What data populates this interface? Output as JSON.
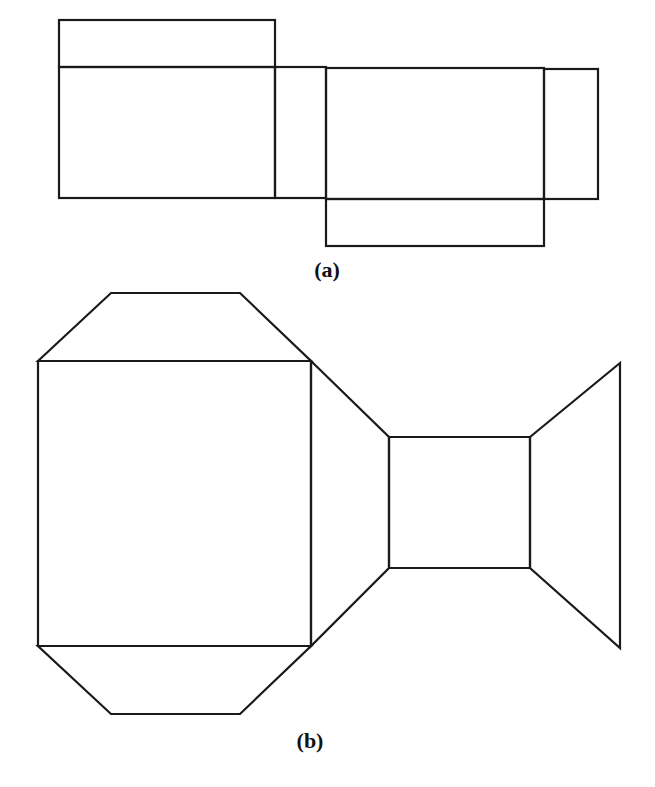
{
  "figure": {
    "stroke_color": "#1a1a1a",
    "background": "#ffffff",
    "panels": [
      {
        "id": "a",
        "caption": "(a)",
        "caption_pos": {
          "x": 327,
          "y": 257
        },
        "description": "Unfolded box net made of rectangles",
        "shapes": [
          {
            "name": "top-flap",
            "type": "rect",
            "x": 59,
            "y": 20,
            "w": 216,
            "h": 47
          },
          {
            "name": "left-face",
            "type": "rect",
            "x": 59,
            "y": 67,
            "w": 216,
            "h": 131
          },
          {
            "name": "left-side-strip",
            "type": "rect",
            "x": 275,
            "y": 67,
            "w": 51,
            "h": 131
          },
          {
            "name": "center-face",
            "type": "rect",
            "x": 326,
            "y": 68,
            "w": 218,
            "h": 131
          },
          {
            "name": "right-side-strip",
            "type": "rect",
            "x": 544,
            "y": 69,
            "w": 54,
            "h": 130
          },
          {
            "name": "bottom-flap",
            "type": "rect",
            "x": 326,
            "y": 199,
            "w": 218,
            "h": 47
          }
        ]
      },
      {
        "id": "b",
        "caption": "(b)",
        "caption_pos": {
          "x": 310,
          "y": 728
        },
        "description": "Perspective room unfold with trapezoid walls",
        "shapes": [
          {
            "name": "top-trapezoid",
            "type": "polygon",
            "points": "38,361 111,293 240,293 311,361"
          },
          {
            "name": "large-square",
            "type": "polygon",
            "points": "38,361 311,361 311,646 38,646"
          },
          {
            "name": "bottom-trapezoid",
            "type": "polygon",
            "points": "38,646 311,646 240,714 111,714"
          },
          {
            "name": "connector-trapezoid",
            "type": "polygon",
            "points": "311,361 389,437 389,568 311,646"
          },
          {
            "name": "small-square",
            "type": "polygon",
            "points": "389,437 530,437 530,568 389,568"
          },
          {
            "name": "right-trapezoid",
            "type": "polygon",
            "points": "530,437 620,363 620,648 530,568"
          }
        ]
      }
    ]
  }
}
